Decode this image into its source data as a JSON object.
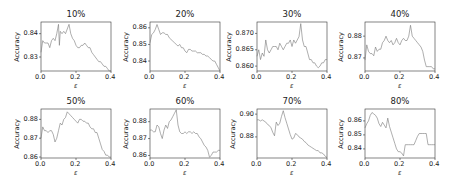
{
  "figure": {
    "xlabel": "ε",
    "ylabel": "Accuracy"
  },
  "chart_data": [
    {
      "type": "line",
      "title": "10%",
      "xlabel": "ε",
      "ylabel": "Accuracy",
      "xlim": [
        0.0,
        0.4
      ],
      "ylim": [
        0.824,
        0.845
      ],
      "xticks": [
        "0.0",
        "0.2",
        "0.4"
      ],
      "yticks": [
        "0.83",
        "0.84"
      ],
      "ytick_values": [
        0.83,
        0.84
      ],
      "x": [
        0.0,
        0.01,
        0.02,
        0.03,
        0.04,
        0.05,
        0.06,
        0.07,
        0.08,
        0.09,
        0.1,
        0.105,
        0.11,
        0.12,
        0.13,
        0.14,
        0.15,
        0.16,
        0.17,
        0.18,
        0.19,
        0.2,
        0.21,
        0.22,
        0.23,
        0.24,
        0.25,
        0.26,
        0.27,
        0.28,
        0.29,
        0.3,
        0.31,
        0.32,
        0.33,
        0.34,
        0.35,
        0.36,
        0.37,
        0.38,
        0.39,
        0.4
      ],
      "y": [
        0.832,
        0.837,
        0.836,
        0.836,
        0.836,
        0.834,
        0.837,
        0.838,
        0.837,
        0.84,
        0.844,
        0.835,
        0.841,
        0.84,
        0.841,
        0.84,
        0.842,
        0.844,
        0.84,
        0.838,
        0.837,
        0.835,
        0.834,
        0.834,
        0.835,
        0.835,
        0.836,
        0.835,
        0.834,
        0.834,
        0.832,
        0.831,
        0.83,
        0.829,
        0.828,
        0.828,
        0.827,
        0.826,
        0.826,
        0.825,
        0.824,
        0.824
      ]
    },
    {
      "type": "line",
      "title": "20%",
      "xlabel": "ε",
      "ylabel": "Accuracy",
      "xlim": [
        0.0,
        0.4
      ],
      "ylim": [
        0.834,
        0.8635
      ],
      "xticks": [
        "0.0",
        "0.2",
        "0.4"
      ],
      "yticks": [
        "0.84",
        "0.85",
        "0.86"
      ],
      "ytick_values": [
        0.84,
        0.85,
        0.86
      ],
      "x": [
        0.0,
        0.01,
        0.02,
        0.03,
        0.04,
        0.05,
        0.06,
        0.07,
        0.08,
        0.09,
        0.1,
        0.11,
        0.12,
        0.13,
        0.14,
        0.15,
        0.16,
        0.17,
        0.18,
        0.19,
        0.2,
        0.21,
        0.22,
        0.23,
        0.24,
        0.25,
        0.26,
        0.27,
        0.28,
        0.29,
        0.3,
        0.31,
        0.32,
        0.33,
        0.34,
        0.35,
        0.36,
        0.37,
        0.38,
        0.39,
        0.4
      ],
      "y": [
        0.851,
        0.856,
        0.857,
        0.859,
        0.862,
        0.859,
        0.856,
        0.857,
        0.857,
        0.856,
        0.856,
        0.854,
        0.853,
        0.852,
        0.851,
        0.85,
        0.849,
        0.85,
        0.848,
        0.848,
        0.846,
        0.845,
        0.847,
        0.847,
        0.846,
        0.846,
        0.846,
        0.845,
        0.845,
        0.845,
        0.844,
        0.844,
        0.843,
        0.843,
        0.842,
        0.841,
        0.84,
        0.84,
        0.838,
        0.836,
        0.834
      ]
    },
    {
      "type": "line",
      "title": "30%",
      "xlabel": "ε",
      "ylabel": "Accuracy",
      "xlim": [
        0.0,
        0.4
      ],
      "ylim": [
        0.8585,
        0.8735
      ],
      "xticks": [
        "0.0",
        "0.2",
        "0.4"
      ],
      "yticks": [
        "0.860",
        "0.865",
        "0.870"
      ],
      "ytick_values": [
        0.86,
        0.865,
        0.87
      ],
      "x": [
        0.0,
        0.01,
        0.02,
        0.03,
        0.04,
        0.05,
        0.06,
        0.07,
        0.08,
        0.09,
        0.1,
        0.11,
        0.12,
        0.13,
        0.14,
        0.15,
        0.16,
        0.17,
        0.18,
        0.19,
        0.2,
        0.21,
        0.22,
        0.23,
        0.24,
        0.25,
        0.26,
        0.27,
        0.28,
        0.29,
        0.3,
        0.31,
        0.32,
        0.33,
        0.34,
        0.35,
        0.36,
        0.37,
        0.38,
        0.39,
        0.4
      ],
      "y": [
        0.863,
        0.865,
        0.862,
        0.864,
        0.863,
        0.868,
        0.865,
        0.864,
        0.865,
        0.866,
        0.866,
        0.866,
        0.865,
        0.867,
        0.866,
        0.865,
        0.866,
        0.867,
        0.867,
        0.868,
        0.866,
        0.868,
        0.867,
        0.868,
        0.869,
        0.873,
        0.868,
        0.866,
        0.866,
        0.864,
        0.862,
        0.862,
        0.861,
        0.861,
        0.86,
        0.8595,
        0.86,
        0.861,
        0.861,
        0.862,
        0.862
      ]
    },
    {
      "type": "line",
      "title": "40%",
      "xlabel": "ε",
      "ylabel": "Accuracy",
      "xlim": [
        0.0,
        0.4
      ],
      "ylim": [
        0.864,
        0.8865
      ],
      "xticks": [
        "0.0",
        "0.2",
        "0.4"
      ],
      "yticks": [
        "0.87",
        "0.88"
      ],
      "ytick_values": [
        0.87,
        0.88
      ],
      "x": [
        0.0,
        0.01,
        0.02,
        0.03,
        0.04,
        0.05,
        0.06,
        0.07,
        0.08,
        0.09,
        0.1,
        0.11,
        0.12,
        0.13,
        0.14,
        0.15,
        0.16,
        0.17,
        0.18,
        0.19,
        0.2,
        0.21,
        0.22,
        0.23,
        0.24,
        0.25,
        0.26,
        0.27,
        0.28,
        0.29,
        0.3,
        0.31,
        0.32,
        0.33,
        0.34,
        0.35,
        0.36,
        0.37,
        0.38,
        0.39,
        0.4
      ],
      "y": [
        0.869,
        0.876,
        0.873,
        0.872,
        0.872,
        0.871,
        0.875,
        0.873,
        0.874,
        0.874,
        0.877,
        0.878,
        0.88,
        0.878,
        0.877,
        0.878,
        0.876,
        0.877,
        0.879,
        0.877,
        0.876,
        0.878,
        0.879,
        0.878,
        0.878,
        0.88,
        0.885,
        0.88,
        0.879,
        0.878,
        0.877,
        0.876,
        0.875,
        0.873,
        0.869,
        0.866,
        0.866,
        0.866,
        0.866,
        0.865,
        0.865
      ]
    },
    {
      "type": "line",
      "title": "50%",
      "xlabel": "ε",
      "ylabel": "Accuracy",
      "xlim": [
        0.0,
        0.4
      ],
      "ylim": [
        0.8595,
        0.8855
      ],
      "xticks": [
        "0.0",
        "0.2",
        "0.4"
      ],
      "yticks": [
        "0.86",
        "0.87",
        "0.88"
      ],
      "ytick_values": [
        0.86,
        0.87,
        0.88
      ],
      "x": [
        0.0,
        0.01,
        0.02,
        0.03,
        0.04,
        0.05,
        0.06,
        0.07,
        0.08,
        0.09,
        0.1,
        0.11,
        0.12,
        0.13,
        0.14,
        0.15,
        0.16,
        0.17,
        0.18,
        0.19,
        0.2,
        0.21,
        0.22,
        0.23,
        0.24,
        0.25,
        0.26,
        0.27,
        0.28,
        0.29,
        0.3,
        0.31,
        0.32,
        0.33,
        0.34,
        0.35,
        0.36,
        0.37,
        0.38,
        0.39,
        0.4
      ],
      "y": [
        0.87,
        0.876,
        0.874,
        0.874,
        0.873,
        0.874,
        0.874,
        0.872,
        0.868,
        0.87,
        0.874,
        0.878,
        0.877,
        0.88,
        0.881,
        0.884,
        0.883,
        0.882,
        0.881,
        0.88,
        0.879,
        0.878,
        0.88,
        0.88,
        0.879,
        0.879,
        0.878,
        0.878,
        0.876,
        0.875,
        0.875,
        0.873,
        0.873,
        0.87,
        0.867,
        0.864,
        0.863,
        0.861,
        0.861,
        0.86,
        0.86
      ]
    },
    {
      "type": "line",
      "title": "60%",
      "xlabel": "ε",
      "ylabel": "Accuracy",
      "xlim": [
        0.0,
        0.4
      ],
      "ylim": [
        0.8585,
        0.8875
      ],
      "xticks": [
        "0.0",
        "0.2",
        "0.4"
      ],
      "yticks": [
        "0.86",
        "0.87",
        "0.88"
      ],
      "ytick_values": [
        0.86,
        0.87,
        0.88
      ],
      "x": [
        0.0,
        0.01,
        0.02,
        0.03,
        0.04,
        0.05,
        0.06,
        0.07,
        0.08,
        0.09,
        0.1,
        0.11,
        0.12,
        0.13,
        0.14,
        0.15,
        0.16,
        0.17,
        0.18,
        0.19,
        0.2,
        0.21,
        0.22,
        0.23,
        0.24,
        0.25,
        0.26,
        0.27,
        0.28,
        0.29,
        0.3,
        0.31,
        0.32,
        0.33,
        0.34,
        0.35,
        0.36,
        0.37,
        0.38,
        0.39,
        0.4
      ],
      "y": [
        0.875,
        0.875,
        0.874,
        0.874,
        0.878,
        0.877,
        0.873,
        0.87,
        0.875,
        0.878,
        0.876,
        0.88,
        0.881,
        0.883,
        0.885,
        0.887,
        0.878,
        0.874,
        0.873,
        0.873,
        0.874,
        0.873,
        0.874,
        0.874,
        0.873,
        0.874,
        0.873,
        0.873,
        0.871,
        0.87,
        0.868,
        0.866,
        0.865,
        0.863,
        0.859,
        0.86,
        0.862,
        0.862,
        0.862,
        0.863,
        0.863
      ]
    },
    {
      "type": "line",
      "title": "70%",
      "xlabel": "ε",
      "ylabel": "Accuracy",
      "xlim": [
        0.0,
        0.4
      ],
      "ylim": [
        0.8615,
        0.9045
      ],
      "xticks": [
        "0.0",
        "0.2",
        "0.4"
      ],
      "yticks": [
        "0.88",
        "0.90"
      ],
      "ytick_values": [
        0.88,
        0.9
      ],
      "x": [
        0.0,
        0.01,
        0.02,
        0.03,
        0.04,
        0.05,
        0.06,
        0.07,
        0.08,
        0.09,
        0.1,
        0.11,
        0.12,
        0.13,
        0.14,
        0.15,
        0.16,
        0.17,
        0.18,
        0.19,
        0.2,
        0.21,
        0.22,
        0.23,
        0.24,
        0.25,
        0.26,
        0.27,
        0.28,
        0.29,
        0.3,
        0.31,
        0.32,
        0.33,
        0.34,
        0.35,
        0.36,
        0.37,
        0.38,
        0.39,
        0.4
      ],
      "y": [
        0.895,
        0.895,
        0.894,
        0.895,
        0.894,
        0.893,
        0.891,
        0.89,
        0.888,
        0.884,
        0.881,
        0.893,
        0.89,
        0.892,
        0.898,
        0.903,
        0.897,
        0.892,
        0.887,
        0.882,
        0.878,
        0.879,
        0.883,
        0.882,
        0.88,
        0.879,
        0.878,
        0.876,
        0.875,
        0.873,
        0.872,
        0.871,
        0.87,
        0.869,
        0.868,
        0.868,
        0.866,
        0.866,
        0.865,
        0.863,
        0.862
      ]
    },
    {
      "type": "line",
      "title": "80%",
      "xlabel": "ε",
      "ylabel": "Accuracy",
      "xlim": [
        0.0,
        0.4
      ],
      "ylim": [
        0.8335,
        0.8685
      ],
      "xticks": [
        "0.0",
        "0.2",
        "0.4"
      ],
      "yticks": [
        "0.84",
        "0.85",
        "0.86"
      ],
      "ytick_values": [
        0.84,
        0.85,
        0.86
      ],
      "x": [
        0.0,
        0.01,
        0.02,
        0.03,
        0.04,
        0.05,
        0.06,
        0.07,
        0.08,
        0.09,
        0.1,
        0.11,
        0.12,
        0.13,
        0.14,
        0.15,
        0.16,
        0.17,
        0.18,
        0.19,
        0.2,
        0.21,
        0.22,
        0.23,
        0.24,
        0.25,
        0.26,
        0.27,
        0.28,
        0.29,
        0.3,
        0.31,
        0.32,
        0.33,
        0.34,
        0.35,
        0.36,
        0.37,
        0.38,
        0.39,
        0.4
      ],
      "y": [
        0.855,
        0.858,
        0.86,
        0.864,
        0.866,
        0.865,
        0.864,
        0.862,
        0.858,
        0.856,
        0.859,
        0.857,
        0.855,
        0.862,
        0.856,
        0.852,
        0.848,
        0.844,
        0.84,
        0.838,
        0.838,
        0.837,
        0.835,
        0.843,
        0.843,
        0.843,
        0.843,
        0.843,
        0.843,
        0.846,
        0.849,
        0.851,
        0.851,
        0.851,
        0.851,
        0.851,
        0.843,
        0.843,
        0.843,
        0.843,
        0.843
      ]
    }
  ]
}
